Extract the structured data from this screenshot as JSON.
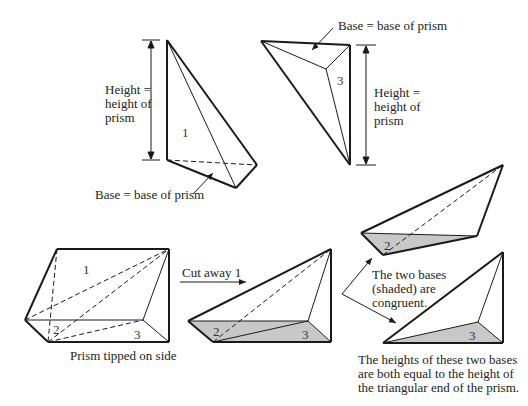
{
  "labels": {
    "height_top_left": [
      "Height =",
      "height of",
      "prism"
    ],
    "height_top_right": [
      "Height =",
      "height of",
      "prism"
    ],
    "base_top_left": "Base = base of prism",
    "base_top_right": "Base = base of prism",
    "prism_caption": "Prism tipped on side",
    "cut_away": "Cut away 1",
    "congruent_note": [
      "The two bases",
      "(shaded) are",
      "congruent."
    ],
    "heights_note": [
      "The heights of these two bases",
      "are both equal to the height of",
      "the triangular end of the prism."
    ]
  },
  "piece_numbers": {
    "p1_top": "1",
    "p3_top": "3",
    "prism_1": "1",
    "prism_2": "2",
    "prism_3": "3",
    "cut_2": "2",
    "cut_3": "3",
    "right_2": "2",
    "right_3": "3"
  },
  "colors": {
    "stroke": "#1a1a1a",
    "shade": "#c8c8c8",
    "background": "#ffffff"
  }
}
